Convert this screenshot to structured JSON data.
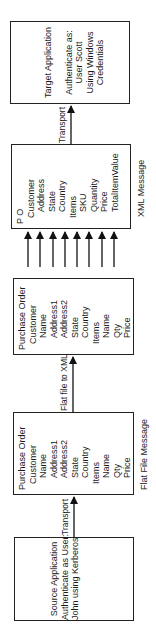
{
  "diagram": {
    "orientation": "rotated-90-ccw",
    "source": {
      "lines": [
        "Source Application",
        "Authenticate as User:",
        "John using Kerberos"
      ]
    },
    "transport_left": {
      "label": "Transport"
    },
    "flat_file": {
      "caption": "Flat File Message",
      "fields": [
        {
          "text": "Purchase Order",
          "level": 0
        },
        {
          "text": "Customer",
          "level": 1
        },
        {
          "text": "Name",
          "level": 2
        },
        {
          "text": "Address1",
          "level": 2
        },
        {
          "text": "Address2",
          "level": 2
        },
        {
          "text": "State",
          "level": 2
        },
        {
          "text": "Country",
          "level": 2
        },
        {
          "text": "Items",
          "level": 1
        },
        {
          "text": "Name",
          "level": 2
        },
        {
          "text": "Qty",
          "level": 2
        },
        {
          "text": "Price",
          "level": 2
        }
      ]
    },
    "convert": {
      "label": "Flat file to XML"
    },
    "flat_parsed": {
      "fields": [
        {
          "text": "Purchase Order",
          "level": 0
        },
        {
          "text": "Customer",
          "level": 1
        },
        {
          "text": "Name",
          "level": 2
        },
        {
          "text": "Address1",
          "level": 2
        },
        {
          "text": "Address2",
          "level": 2
        },
        {
          "text": "State",
          "level": 2
        },
        {
          "text": "Country",
          "level": 2
        },
        {
          "text": "Items",
          "level": 1
        },
        {
          "text": "Name",
          "level": 2
        },
        {
          "text": "Qty",
          "level": 2
        },
        {
          "text": "Price",
          "level": 2
        }
      ]
    },
    "mapping_arrows": 8,
    "xml": {
      "caption": "XML Message",
      "fields": [
        {
          "text": "P O",
          "level": 0
        },
        {
          "text": "Customer",
          "level": 1
        },
        {
          "text": "Address",
          "level": 2
        },
        {
          "text": "State",
          "level": 2
        },
        {
          "text": "Country",
          "level": 2
        },
        {
          "text": "Items",
          "level": 1
        },
        {
          "text": "SKU",
          "level": 2
        },
        {
          "text": "Quantity",
          "level": 2
        },
        {
          "text": "Price",
          "level": 2
        },
        {
          "text": "TotalItemValue",
          "level": 2
        }
      ]
    },
    "transport_right": {
      "label": "Transport"
    },
    "target": {
      "lines": [
        "Target Application",
        "",
        "Authenticate as:",
        "User Scott",
        "Using Windows",
        "Credentials"
      ]
    }
  }
}
